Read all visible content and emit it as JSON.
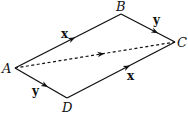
{
  "diagram": {
    "type": "parallelogram-vectors",
    "points": {
      "A": {
        "label": "A",
        "x": 15,
        "y": 68
      },
      "B": {
        "label": "B",
        "x": 121,
        "y": 14
      },
      "C": {
        "label": "C",
        "x": 175,
        "y": 42
      },
      "D": {
        "label": "D",
        "x": 67,
        "y": 98
      }
    },
    "edges": [
      {
        "from": "A",
        "to": "B",
        "label": "x",
        "style": "solid"
      },
      {
        "from": "B",
        "to": "C",
        "label": "y",
        "style": "solid"
      },
      {
        "from": "A",
        "to": "D",
        "label": "y",
        "style": "solid"
      },
      {
        "from": "D",
        "to": "C",
        "label": "x",
        "style": "solid"
      },
      {
        "from": "A",
        "to": "C",
        "label": "",
        "style": "dashed"
      }
    ],
    "colors": {
      "stroke": "#111111",
      "background": "#ffffff"
    }
  }
}
